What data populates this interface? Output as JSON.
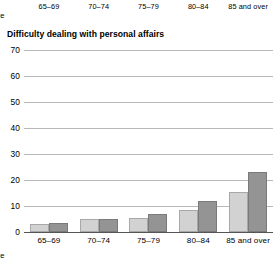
{
  "top_partial_chart": {
    "axis_name": "ge",
    "categories": [
      "65–69",
      "70–74",
      "75–79",
      "80–84",
      "85 and over"
    ]
  },
  "bottom_axis_name": "ge",
  "colors": {
    "series_light": "#d2d2d2",
    "series_dark": "#949494",
    "gridline": "#b8b8b8",
    "baseline": "#555555",
    "text": "#000000"
  },
  "chart_data": {
    "type": "bar",
    "title": "Difficulty dealing with personal affairs",
    "xlabel": "ge",
    "ylabel": "",
    "categories": [
      "65–69",
      "70–74",
      "75–79",
      "80–84",
      "85 and over"
    ],
    "series": [
      {
        "name": "series-1",
        "color": "#d2d2d2",
        "values": [
          3,
          5,
          5.5,
          8.5,
          15.5
        ]
      },
      {
        "name": "series-2",
        "color": "#949494",
        "values": [
          3.5,
          5,
          7,
          12,
          23
        ]
      }
    ],
    "ylim": [
      0,
      70
    ],
    "yticks": [
      0,
      10,
      20,
      30,
      40,
      50,
      60,
      70
    ],
    "ytick_labels": [
      "0",
      "10",
      "20",
      "30",
      "40",
      "50",
      "60",
      "70"
    ],
    "grid": true,
    "legend": null
  }
}
